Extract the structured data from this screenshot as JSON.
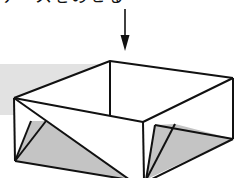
{
  "diagram": {
    "type": "origami-instruction-step",
    "caption": "ケースをのせる",
    "caption_note": "top caption clipped; only bottom edge of glyphs visible",
    "colors": {
      "line": "#111111",
      "shade": "#c4c4c4",
      "background_shade": "#e2e2e2",
      "paper": "#ffffff"
    },
    "arrow": {
      "x": 125,
      "y1": 9,
      "y2": 51,
      "direction": "down"
    },
    "box": {
      "vertices": {
        "back_top": [
          110,
          61
        ],
        "left_top": [
          14,
          98
        ],
        "front_top": [
          143,
          122
        ],
        "right_top": [
          233,
          78
        ],
        "left_bottom": [
          15,
          161
        ],
        "front_bottom": [
          145,
          180
        ],
        "right_bottom": [
          233,
          139
        ],
        "back_inner_bottom": [
          110,
          115
        ]
      }
    }
  }
}
